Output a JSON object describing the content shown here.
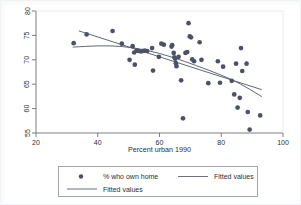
{
  "chart_data": {
    "type": "scatter",
    "title": "",
    "xlabel": "Percent urban 1990",
    "ylabel": "",
    "xlim": [
      20,
      100
    ],
    "ylim": [
      55,
      80
    ],
    "xticks": [
      20,
      40,
      60,
      80,
      100
    ],
    "yticks": [
      55,
      60,
      65,
      70,
      75,
      80
    ],
    "grid": false,
    "legend_position": "below-outside",
    "legend": [
      {
        "label": "% who own home",
        "marker": "circle",
        "color": "#4a4f63"
      },
      {
        "label": "Fitted values",
        "marker": "line",
        "color": "#4a4f63"
      },
      {
        "label": "Fitted values",
        "marker": "line",
        "color": "#4a4f63"
      }
    ],
    "series": [
      {
        "name": "% who own home",
        "type": "scatter",
        "marker_color": "#4d5168",
        "points": [
          [
            32.2,
            73.4
          ],
          [
            36.4,
            75.2
          ],
          [
            44.8,
            75.9
          ],
          [
            47.8,
            73.3
          ],
          [
            50.3,
            70.0
          ],
          [
            51.3,
            72.8
          ],
          [
            51.8,
            71.5
          ],
          [
            52.0,
            69.0
          ],
          [
            52.6,
            71.9
          ],
          [
            53.2,
            71.8
          ],
          [
            54.0,
            71.7
          ],
          [
            54.6,
            71.8
          ],
          [
            55.2,
            71.9
          ],
          [
            56.0,
            71.8
          ],
          [
            57.6,
            72.4
          ],
          [
            57.9,
            67.8
          ],
          [
            59.8,
            70.6
          ],
          [
            60.6,
            73.3
          ],
          [
            61.4,
            73.1
          ],
          [
            63.9,
            72.7
          ],
          [
            64.1,
            73.0
          ],
          [
            64.6,
            71.4
          ],
          [
            64.8,
            70.5
          ],
          [
            65.1,
            70.2
          ],
          [
            65.3,
            69.3
          ],
          [
            65.5,
            68.7
          ],
          [
            66.2,
            70.6
          ],
          [
            67.0,
            65.8
          ],
          [
            67.6,
            58.0
          ],
          [
            68.4,
            71.4
          ],
          [
            69.0,
            71.6
          ],
          [
            69.4,
            77.5
          ],
          [
            69.8,
            74.8
          ],
          [
            70.2,
            74.6
          ],
          [
            70.6,
            70.1
          ],
          [
            71.2,
            69.7
          ],
          [
            73.0,
            73.6
          ],
          [
            73.6,
            70.0
          ],
          [
            75.8,
            65.2
          ],
          [
            78.9,
            69.7
          ],
          [
            79.6,
            65.3
          ],
          [
            80.6,
            68.6
          ],
          [
            83.4,
            65.7
          ],
          [
            84.2,
            62.9
          ],
          [
            84.8,
            69.2
          ],
          [
            85.3,
            60.2
          ],
          [
            86.0,
            62.2
          ],
          [
            86.4,
            72.4
          ],
          [
            86.8,
            67.7
          ],
          [
            88.2,
            69.2
          ],
          [
            88.6,
            59.3
          ],
          [
            89.2,
            55.7
          ],
          [
            92.6,
            58.6
          ]
        ]
      },
      {
        "name": "Fitted values",
        "type": "line",
        "color": "#5a5f70",
        "description": "linear fit, straight declining line",
        "points": [
          [
            34.0,
            75.9
          ],
          [
            93.0,
            63.9
          ]
        ]
      },
      {
        "name": "Fitted values",
        "type": "line",
        "color": "#5a5f70",
        "description": "quadratic fit, gently curving line",
        "points": [
          [
            32.0,
            72.6
          ],
          [
            40.0,
            72.9
          ],
          [
            48.0,
            72.8
          ],
          [
            56.0,
            72.0
          ],
          [
            64.0,
            70.6
          ],
          [
            72.0,
            68.8
          ],
          [
            80.0,
            66.9
          ],
          [
            86.0,
            65.2
          ],
          [
            93.0,
            62.5
          ]
        ]
      }
    ]
  },
  "axes": {
    "x_tick_labels": [
      "20",
      "40",
      "60",
      "80",
      "100"
    ],
    "y_tick_labels": [
      "55",
      "60",
      "65",
      "70",
      "75",
      "80"
    ],
    "x_axis_title": "Percent urban 1990"
  },
  "legend_box": {
    "row1_marker_label": "% who own home",
    "row1_line_label": "Fitted values",
    "row2_line_label": "Fitted values"
  },
  "colors": {
    "marker": "#4d5168",
    "line": "#5a5f70",
    "axis": "#6b7077",
    "text": "#2b2f36",
    "plot_background": "#ffffff",
    "figure_background": "#ffffff"
  }
}
